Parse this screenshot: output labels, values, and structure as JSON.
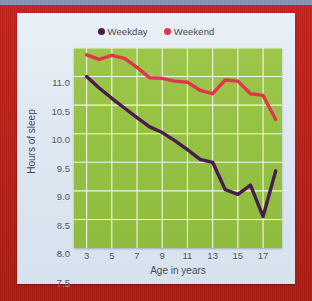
{
  "frame": {
    "border_color": "#bb2019",
    "top_strip_color": "#8296b2",
    "card_color": "#e2ebf4"
  },
  "legend": {
    "position": "top-center",
    "items": [
      {
        "label": "Weekday",
        "color": "#4a1b4e",
        "marker": "legend-dot-weekday"
      },
      {
        "label": "Weekend",
        "color": "#e0364c",
        "marker": "legend-dot-weekend"
      }
    ]
  },
  "chart_data": {
    "type": "line",
    "title": "",
    "xlabel": "Age in years",
    "ylabel": "Hours of sleep",
    "xlim": [
      2,
      18.5
    ],
    "ylim": [
      7.5,
      11.0
    ],
    "xticks": [
      3,
      5,
      7,
      9,
      11,
      13,
      15,
      17
    ],
    "yticks": [
      "7.5",
      "8.0",
      "8.5",
      "9.0",
      "9.5",
      "10.0",
      "10.5",
      "11.0"
    ],
    "grid": true,
    "grid_color": "#f2f6ea",
    "plot_bg": "#96c244",
    "legend_position": "top-center",
    "x": [
      3,
      4,
      5,
      6,
      7,
      8,
      9,
      10,
      11,
      12,
      13,
      14,
      15,
      16,
      17,
      18
    ],
    "series": [
      {
        "name": "Weekday",
        "color": "#4a1b4e",
        "values": [
          10.5,
          10.3,
          10.12,
          9.95,
          9.78,
          9.62,
          9.52,
          9.38,
          9.22,
          9.05,
          9.0,
          8.52,
          8.44,
          8.6,
          8.05,
          8.85
        ]
      },
      {
        "name": "Weekend",
        "color": "#e0364c",
        "values": [
          10.88,
          10.8,
          10.87,
          10.82,
          10.66,
          10.48,
          10.47,
          10.42,
          10.4,
          10.26,
          10.2,
          10.44,
          10.42,
          10.2,
          10.17,
          9.75
        ]
      }
    ]
  }
}
